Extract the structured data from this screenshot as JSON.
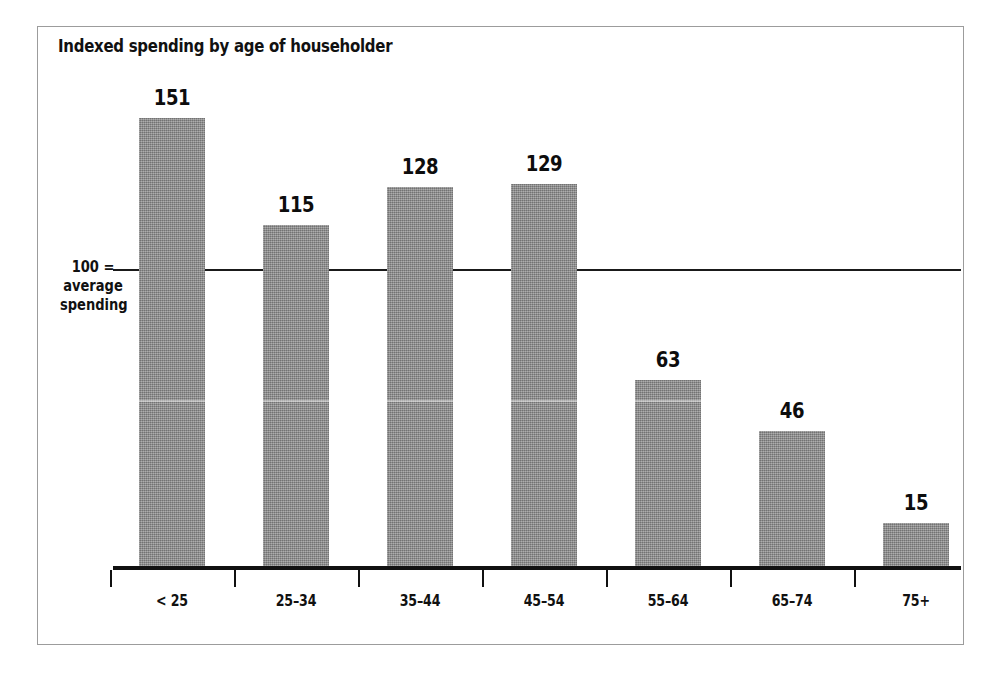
{
  "chart_data": {
    "type": "bar",
    "title": "Indexed spending by age of householder",
    "xlabel": "",
    "ylabel": "100 = average spending",
    "categories": [
      "< 25",
      "25–34",
      "35–44",
      "45–54",
      "55–64",
      "65–74",
      "75+"
    ],
    "values": [
      151,
      115,
      128,
      129,
      63,
      46,
      15
    ],
    "value_labels": [
      "151",
      "115",
      "128",
      "129",
      "63",
      "46",
      "15"
    ],
    "reference_line": {
      "value": 100,
      "label_lines": [
        "100 =",
        "average",
        "spending"
      ]
    },
    "ylim": [
      0,
      190
    ],
    "grid": false,
    "legend": false,
    "bar_color": "#8d8d8d",
    "axis_color": "#111111",
    "text_color": "#111111",
    "background": "#ffffff",
    "frame_color": "#9c9c9c"
  },
  "figure": {
    "title": "Indexed spending by age of householder"
  }
}
